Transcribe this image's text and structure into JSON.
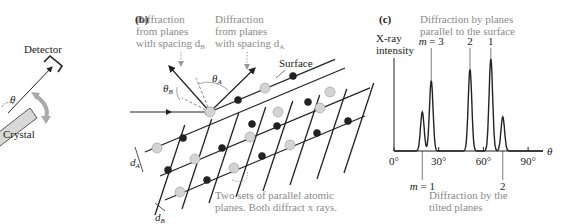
{
  "panel_a": {
    "detector_label": "Detector",
    "crystal_label": "Crystal",
    "angle_label": "θ"
  },
  "panel_b": {
    "panel_label": "(b)",
    "note_b": [
      "Diffraction",
      "from planes",
      "with spacing d"
    ],
    "note_b_sub": "B",
    "note_a": [
      "Diffraction",
      "from planes",
      "with spacing d"
    ],
    "note_a_sub": "A",
    "surface_label": "Surface",
    "theta_b": "θ",
    "theta_b_sub": "B",
    "theta_a": "θ",
    "theta_a_sub": "A",
    "d_a": "d",
    "d_a_sub": "A",
    "d_b": "d",
    "d_b_sub": "B",
    "caption": [
      "Two sets of parallel atomic",
      "planes. Both diffract x rays."
    ]
  },
  "panel_c": {
    "panel_label": "(c)",
    "top_note": [
      "Diffraction by planes",
      "parallel to the surface"
    ],
    "bottom_note": [
      "Diffraction by the",
      "tilted planes"
    ],
    "colors": {
      "annotation": "#8a8a8a",
      "line": "#222222"
    }
  },
  "chart_data": {
    "type": "line",
    "title": "",
    "xlabel": "θ",
    "ylabel": "X-ray intensity",
    "xlim": [
      0,
      100
    ],
    "ylim": [
      0,
      1
    ],
    "xticks": [
      0,
      30,
      60,
      90
    ],
    "xtick_labels": [
      "0°",
      "30°",
      "60°",
      "90°"
    ],
    "grid": false,
    "peaks": [
      {
        "x": 19,
        "height": 0.41,
        "group": "tilted",
        "label": "m = 1"
      },
      {
        "x": 25,
        "height": 0.74,
        "group": "parallel",
        "label": "m = 3"
      },
      {
        "x": 51,
        "height": 0.86,
        "group": "parallel",
        "label": "2"
      },
      {
        "x": 65,
        "height": 0.97,
        "group": "parallel",
        "label": "1"
      },
      {
        "x": 73,
        "height": 0.36,
        "group": "tilted",
        "label": "2"
      }
    ]
  }
}
